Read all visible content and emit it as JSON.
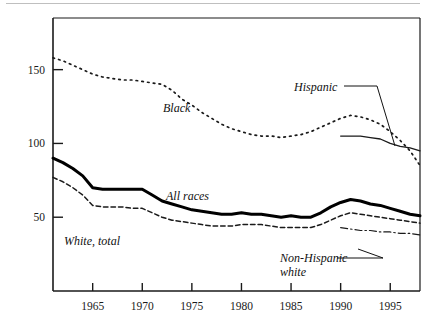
{
  "chart_data": {
    "type": "line",
    "title": "",
    "subtitle": "",
    "xlabel": "",
    "ylabel": "",
    "xlim": [
      1961,
      1998
    ],
    "ylim": [
      0,
      185
    ],
    "grid": false,
    "legend_position": "inline-annotations",
    "x_ticks": [
      1965,
      1970,
      1975,
      1980,
      1985,
      1990,
      1995
    ],
    "x_tick_labels": [
      "1965",
      "1970",
      "1975",
      "1980",
      "1985",
      "1990",
      "1995"
    ],
    "y_ticks": [
      50,
      100,
      150
    ],
    "y_tick_labels": [
      "50",
      "100",
      "150"
    ],
    "series": [
      {
        "name": "Black",
        "label": "Black",
        "style": "dotted",
        "color": "#1a1a1a",
        "x": [
          1961,
          1962,
          1963,
          1964,
          1965,
          1966,
          1967,
          1968,
          1969,
          1970,
          1971,
          1972,
          1973,
          1974,
          1975,
          1976,
          1977,
          1978,
          1979,
          1980,
          1981,
          1982,
          1983,
          1984,
          1985,
          1986,
          1987,
          1988,
          1989,
          1990,
          1991,
          1992,
          1993,
          1994,
          1995,
          1996,
          1997,
          1998
        ],
        "values": [
          158,
          156,
          153,
          150,
          147,
          145,
          144,
          143,
          143,
          142,
          141,
          140,
          136,
          130,
          126,
          121,
          117,
          113,
          110,
          108,
          106,
          105,
          105,
          104,
          105,
          106,
          108,
          111,
          114,
          117,
          119,
          118,
          116,
          113,
          108,
          102,
          95,
          85
        ]
      },
      {
        "name": "All races",
        "label": "All races",
        "style": "solid-thick",
        "color": "#000000",
        "x": [
          1961,
          1962,
          1963,
          1964,
          1965,
          1966,
          1967,
          1968,
          1969,
          1970,
          1971,
          1972,
          1973,
          1974,
          1975,
          1976,
          1977,
          1978,
          1979,
          1980,
          1981,
          1982,
          1983,
          1984,
          1985,
          1986,
          1987,
          1988,
          1989,
          1990,
          1991,
          1992,
          1993,
          1994,
          1995,
          1996,
          1997,
          1998
        ],
        "values": [
          90,
          87,
          83,
          78,
          70,
          69,
          69,
          69,
          69,
          69,
          65,
          61,
          59,
          57,
          55,
          54,
          53,
          52,
          52,
          53,
          52,
          52,
          51,
          50,
          51,
          50,
          50,
          53,
          57,
          60,
          62,
          61,
          59,
          58,
          56,
          54,
          52,
          51
        ]
      },
      {
        "name": "White, total",
        "label": "White, total",
        "style": "dashed",
        "color": "#1a1a1a",
        "x": [
          1961,
          1962,
          1963,
          1964,
          1965,
          1966,
          1967,
          1968,
          1969,
          1970,
          1971,
          1972,
          1973,
          1974,
          1975,
          1976,
          1977,
          1978,
          1979,
          1980,
          1981,
          1982,
          1983,
          1984,
          1985,
          1986,
          1987,
          1988,
          1989,
          1990,
          1991,
          1992,
          1993,
          1994,
          1995,
          1996,
          1997,
          1998
        ],
        "values": [
          77,
          74,
          70,
          65,
          58,
          57,
          57,
          57,
          56,
          56,
          53,
          50,
          48,
          47,
          46,
          45,
          44,
          44,
          44,
          45,
          45,
          45,
          44,
          43,
          43,
          43,
          43,
          45,
          48,
          51,
          53,
          52,
          51,
          50,
          49,
          48,
          47,
          46
        ]
      },
      {
        "name": "Hispanic",
        "label": "Hispanic",
        "style": "solid-thin",
        "color": "#1a1a1a",
        "x": [
          1990,
          1991,
          1992,
          1993,
          1994,
          1995,
          1996,
          1997,
          1998
        ],
        "values": [
          105,
          105,
          105,
          104,
          103,
          100,
          98,
          97,
          95
        ]
      },
      {
        "name": "Non-Hispanic white",
        "label": "Non-Hispanic white",
        "style": "dash-dot",
        "color": "#1a1a1a",
        "x": [
          1990,
          1991,
          1992,
          1993,
          1994,
          1995,
          1996,
          1997,
          1998
        ],
        "values": [
          43,
          42,
          41,
          41,
          40,
          40,
          39,
          39,
          38
        ]
      }
    ],
    "annotations": [
      {
        "name": "black-label",
        "text": "Black",
        "x": 163,
        "y": 112
      },
      {
        "name": "all-races-label",
        "text": "All races",
        "x": 166,
        "y": 200
      },
      {
        "name": "white-label",
        "text": "White, total",
        "x": 64,
        "y": 245
      },
      {
        "name": "hispanic-label",
        "text": "Hispanic",
        "x": 294,
        "y": 91
      },
      {
        "name": "nhw-label-1",
        "text": "Non-Hispanic",
        "x": 280,
        "y": 262
      },
      {
        "name": "nhw-label-2",
        "text": "white",
        "x": 280,
        "y": 276
      }
    ]
  },
  "colors": {
    "axis": "#1a1a1a",
    "ink": "#111111",
    "background": "#ffffff",
    "top_rule": "#bfbfbf"
  }
}
